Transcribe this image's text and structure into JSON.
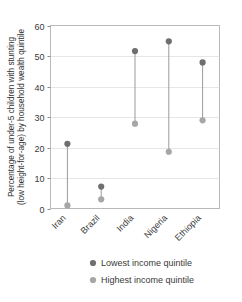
{
  "chart_data": {
    "type": "scatter",
    "title": "",
    "subtitle": "",
    "xlabel": "",
    "ylabel_line1": "Percentage of under-5 children with stunting",
    "ylabel_line2": "(low height-for-age) by household wealth quintile",
    "categories": [
      "Iran",
      "Brazil",
      "India",
      "Nigeria",
      "Ethiopia"
    ],
    "series": [
      {
        "name": "Lowest income quintile",
        "color": "#6f6f6f",
        "values": [
          21.2,
          7.2,
          51.6,
          54.8,
          47.9
        ]
      },
      {
        "name": "Highest income quintile",
        "color": "#a6a6a6",
        "values": [
          1.0,
          3.0,
          27.8,
          18.6,
          28.9
        ]
      }
    ],
    "ylim": [
      0,
      60
    ],
    "yticks": [
      0,
      10,
      20,
      30,
      40,
      50,
      60
    ],
    "ytick_labels": [
      "0",
      "10",
      "20",
      "30",
      "40",
      "50",
      "60"
    ],
    "grid": true,
    "grid_axis": "y",
    "legend_position": "bottom",
    "connector_color": "#9a9a9a",
    "frame_color": "#b9b9b9",
    "gridline_color": "#e6e6e6",
    "category_label_rotation": -45
  },
  "legend": {
    "items": [
      {
        "label": "Lowest income quintile",
        "color": "#6f6f6f"
      },
      {
        "label": "Highest income quintile",
        "color": "#a6a6a6"
      }
    ]
  }
}
